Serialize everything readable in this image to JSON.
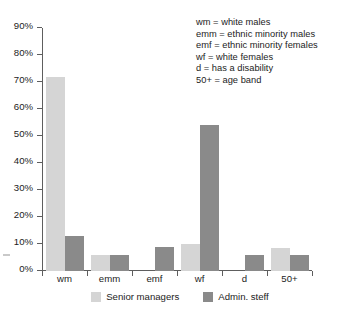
{
  "chart_data": {
    "type": "bar",
    "title": "",
    "subtitle": "",
    "xlabel": "",
    "ylabel": "",
    "categories": [
      "wm",
      "emm",
      "emf",
      "wf",
      "d",
      "50+"
    ],
    "series": [
      {
        "name": "Senior managers",
        "color": "#d5d5d5",
        "values": [
          72,
          6,
          0,
          10,
          0,
          8.5
        ]
      },
      {
        "name": "Admin. steff",
        "color": "#8a8a8a",
        "values": [
          13,
          6,
          9,
          54,
          6,
          6
        ]
      }
    ],
    "ylim": [
      0,
      90
    ],
    "ytick_step": 10,
    "ytick_labels": [
      "0%",
      "10%",
      "20%",
      "30%",
      "40%",
      "50%",
      "60%",
      "70%",
      "80%",
      "90%"
    ],
    "grid": false,
    "legend_position": "bottom-center",
    "value_suffix": "%"
  },
  "key_block": {
    "lines": [
      "wm = white males",
      "emm = ethnic minority males",
      "emf = ethnic minority females",
      "wf = white females",
      "d = has a disability",
      "50+ = age band"
    ]
  }
}
